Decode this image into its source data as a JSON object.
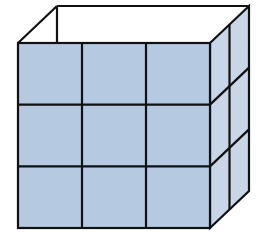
{
  "diagram": {
    "front_rows": 3,
    "front_cols": 3,
    "side_cols": 2,
    "side_rows": 3,
    "colors": {
      "front": "#b5c9e1",
      "side": "#c8d6e7",
      "top_open": "#ffffff",
      "stroke": "#111111"
    },
    "geometry": {
      "front": {
        "x0": 18,
        "y0": 43,
        "x1": 210,
        "y1": 228
      },
      "depth_offset": {
        "dx": 39,
        "dy": -37
      }
    }
  }
}
